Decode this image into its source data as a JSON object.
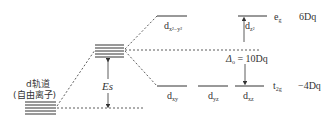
{
  "diagram": {
    "free_ion_label_line1": "d轨道",
    "free_ion_label_line2": "(自由离子)",
    "es_label": "Es",
    "orbitals": {
      "dx2y2": "d",
      "dx2y2_sub": "x²−y²",
      "dz2": "d",
      "dz2_sub": "z²",
      "dxy": "d",
      "dxy_sub": "xy",
      "dyz": "d",
      "dyz_sub": "yz",
      "dxz": "d",
      "dxz_sub": "xz"
    },
    "eg_label": "e",
    "eg_sub": "g",
    "t2g_label": "t",
    "t2g_sub": "2g",
    "eg_energy": "6Dq",
    "t2g_energy": "−4Dq",
    "delta_symbol": "Δ",
    "delta_sub": "o",
    "delta_value": " = 10Dq",
    "colors": {
      "line": "#333333",
      "text": "#333333"
    }
  }
}
